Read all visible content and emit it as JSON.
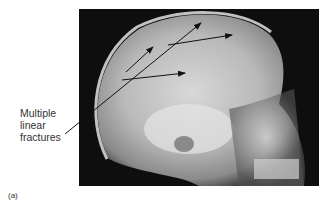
{
  "figure": {
    "panel_label": "(a)",
    "annotation": {
      "lines": [
        "Multiple",
        "linear",
        "fractures"
      ]
    },
    "image_description": "Lateral skull X-ray showing multiple linear fractures"
  }
}
